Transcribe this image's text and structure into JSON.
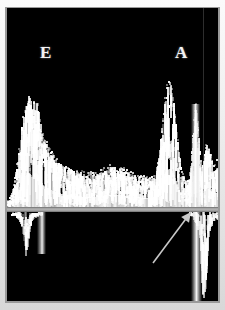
{
  "figure": {
    "modality": "pulsed-wave-doppler-spectral-trace",
    "background_color": "#000000",
    "frame_color": "#e8e8e8",
    "trace_color": "#ffffff",
    "baseline_color": "#b4b4b4",
    "annotation_color": "#c8c8c8"
  },
  "labels": {
    "e_wave": "E",
    "a_wave": "A"
  },
  "annotations": [
    {
      "name": "pointer-arrow",
      "kind": "arrow",
      "tail_x": 146,
      "tail_y": 255,
      "tip_x": 184,
      "tip_y": 204
    }
  ],
  "chart_data": {
    "type": "area",
    "title": "",
    "subtitle": "",
    "xlabel": "",
    "ylabel": "",
    "grid": false,
    "legend": null,
    "xlim": [
      0,
      211
    ],
    "ylim": [
      0,
      199
    ],
    "annotation_labels": [
      "E",
      "A"
    ],
    "series": [
      {
        "name": "spectral-doppler-envelope-above-baseline",
        "values": [
          6,
          7,
          8,
          10,
          13,
          17,
          22,
          28,
          35,
          42,
          50,
          58,
          66,
          74,
          82,
          90,
          97,
          103,
          108,
          112,
          114,
          113,
          110,
          106,
          101,
          104,
          109,
          112,
          113,
          111,
          106,
          100,
          93,
          86,
          80,
          75,
          71,
          68,
          66,
          64,
          62,
          60,
          59,
          57,
          56,
          54,
          53,
          51,
          50,
          49,
          48,
          47,
          46,
          45,
          44,
          43,
          43,
          42,
          41,
          41,
          40,
          40,
          39,
          39,
          38,
          38,
          38,
          37,
          37,
          37,
          36,
          36,
          36,
          36,
          35,
          35,
          35,
          35,
          35,
          34,
          34,
          34,
          34,
          34,
          34,
          34,
          34,
          34,
          35,
          35,
          35,
          36,
          36,
          37,
          37,
          38,
          38,
          39,
          39,
          40,
          40,
          40,
          41,
          41,
          41,
          41,
          41,
          41,
          41,
          41,
          40,
          40,
          40,
          39,
          39,
          38,
          38,
          37,
          37,
          36,
          36,
          35,
          35,
          34,
          34,
          34,
          33,
          33,
          33,
          32,
          32,
          32,
          32,
          31,
          31,
          31,
          31,
          30,
          30,
          30,
          30,
          30,
          30,
          30,
          30,
          31,
          32,
          34,
          37,
          41,
          46,
          53,
          61,
          70,
          80,
          90,
          100,
          109,
          116,
          121,
          124,
          126,
          126,
          124,
          120,
          114,
          106,
          97,
          87,
          77,
          67,
          58,
          50,
          43,
          37,
          33,
          30,
          28,
          27,
          27,
          28,
          31,
          36,
          44,
          56,
          72,
          88,
          100,
          104,
          100,
          88,
          72,
          58,
          48,
          44,
          46,
          52,
          58,
          62,
          64,
          63,
          60,
          56,
          52,
          49,
          47,
          46,
          46,
          47,
          48,
          49
        ]
      },
      {
        "name": "tissue-signal-below-baseline",
        "values": [
          2,
          2,
          3,
          3,
          4,
          4,
          5,
          5,
          6,
          6,
          7,
          8,
          10,
          14,
          20,
          28,
          36,
          42,
          44,
          42,
          36,
          28,
          20,
          14,
          10,
          8,
          7,
          6,
          6,
          5,
          5,
          4,
          4,
          4,
          4,
          3,
          3,
          3,
          3,
          3,
          3,
          3,
          3,
          3,
          3,
          3,
          3,
          3,
          3,
          3,
          3,
          3,
          3,
          3,
          3,
          3,
          3,
          3,
          3,
          3,
          3,
          3,
          3,
          3,
          3,
          3,
          3,
          3,
          3,
          3,
          3,
          3,
          3,
          3,
          3,
          3,
          3,
          3,
          3,
          3,
          3,
          3,
          3,
          3,
          3,
          3,
          3,
          3,
          3,
          3,
          3,
          3,
          3,
          3,
          3,
          3,
          3,
          3,
          3,
          3,
          3,
          3,
          3,
          3,
          3,
          3,
          3,
          3,
          3,
          3,
          3,
          3,
          3,
          3,
          3,
          3,
          3,
          3,
          3,
          3,
          3,
          3,
          3,
          3,
          3,
          3,
          3,
          3,
          3,
          3,
          3,
          3,
          3,
          3,
          3,
          3,
          3,
          3,
          3,
          3,
          3,
          3,
          3,
          3,
          3,
          3,
          3,
          3,
          3,
          3,
          3,
          3,
          3,
          3,
          3,
          3,
          3,
          3,
          3,
          3,
          3,
          3,
          3,
          3,
          3,
          3,
          3,
          3,
          3,
          3,
          3,
          3,
          3,
          3,
          3,
          3,
          3,
          3,
          3,
          3,
          3,
          3,
          4,
          4,
          5,
          6,
          8,
          10,
          12,
          14,
          18,
          26,
          40,
          58,
          74,
          84,
          88,
          86,
          78,
          64,
          48,
          34,
          24,
          18,
          14,
          12,
          11,
          10,
          10,
          10,
          10
        ]
      }
    ]
  }
}
